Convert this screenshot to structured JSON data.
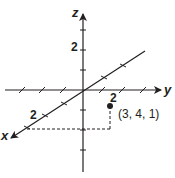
{
  "diagram": {
    "type": "3d-coordinate-axes",
    "axes": {
      "x": {
        "label": "x",
        "tick_label": "2"
      },
      "y": {
        "label": "y",
        "tick_label": "2"
      },
      "z": {
        "label": "z",
        "tick_label": "2"
      }
    },
    "point": {
      "coordinates": [
        3,
        4,
        1
      ],
      "label": "(3, 4, 1)"
    },
    "colors": {
      "ink": "#231f20",
      "background": "#ffffff"
    }
  }
}
